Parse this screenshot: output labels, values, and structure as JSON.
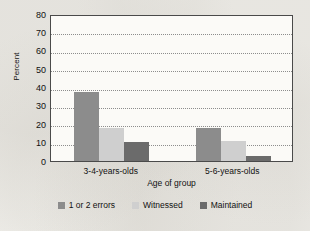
{
  "chart_data": {
    "type": "bar",
    "title": "",
    "xlabel": "Age of group",
    "ylabel": "Percent",
    "categories": [
      "3-4-years-olds",
      "5-6-years-olds"
    ],
    "series": [
      {
        "name": "1 or 2 errors",
        "values": [
          37.5,
          18
        ],
        "color": "#8c8c8c"
      },
      {
        "name": "Witnessed",
        "values": [
          18,
          11
        ],
        "color": "#cfcfcf"
      },
      {
        "name": "Maintained",
        "values": [
          10.5,
          3
        ],
        "color": "#6b6b6b"
      }
    ],
    "ylim": [
      0,
      80
    ],
    "yticks": [
      0,
      10,
      20,
      30,
      40,
      50,
      60,
      70,
      80
    ],
    "ytick_labels": [
      "0",
      "10",
      "20",
      "30",
      "40",
      "50",
      "60",
      "70",
      "80"
    ],
    "grid": "horizontal-dotted",
    "legend_position": "bottom"
  },
  "colors": {
    "series_1": "#8c8c8c",
    "series_2": "#cfcfcf",
    "series_3": "#6b6b6b",
    "plot_background": "#fbfaf7",
    "page_background": "#f2f1ed",
    "axis_line": "#4a4a4a",
    "gridline": "#8d8d8d"
  }
}
